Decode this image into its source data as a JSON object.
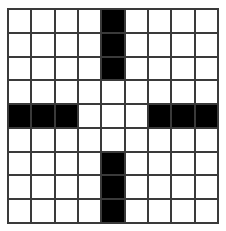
{
  "puzzle": {
    "type": "crossword-grid",
    "rows": 9,
    "cols": 9,
    "colors": {
      "white": "#ffffff",
      "black": "#000000",
      "grid_line": "#3a3a3a"
    },
    "grid": [
      [
        0,
        0,
        0,
        0,
        1,
        0,
        0,
        0,
        0
      ],
      [
        0,
        0,
        0,
        0,
        1,
        0,
        0,
        0,
        0
      ],
      [
        0,
        0,
        0,
        0,
        1,
        0,
        0,
        0,
        0
      ],
      [
        0,
        0,
        0,
        0,
        0,
        0,
        0,
        0,
        0
      ],
      [
        1,
        1,
        1,
        0,
        0,
        0,
        1,
        1,
        1
      ],
      [
        0,
        0,
        0,
        0,
        0,
        0,
        0,
        0,
        0
      ],
      [
        0,
        0,
        0,
        0,
        1,
        0,
        0,
        0,
        0
      ],
      [
        0,
        0,
        0,
        0,
        1,
        0,
        0,
        0,
        0
      ],
      [
        0,
        0,
        0,
        0,
        1,
        0,
        0,
        0,
        0
      ]
    ]
  }
}
